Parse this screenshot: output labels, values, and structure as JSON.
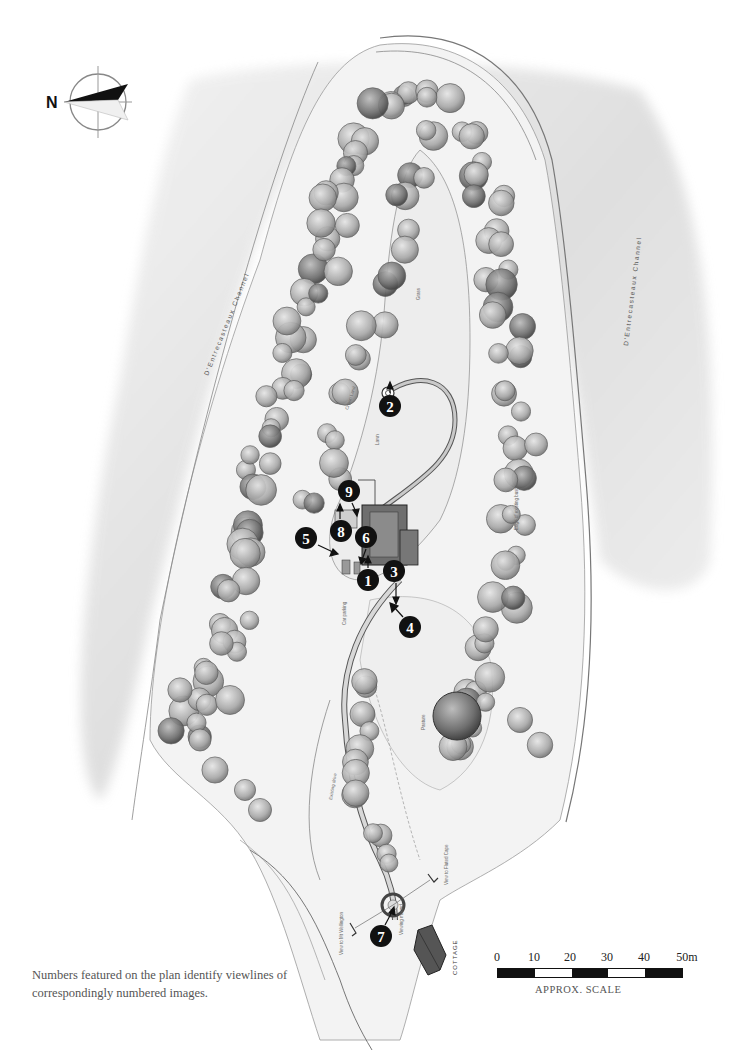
{
  "compass": {
    "north_label": "N",
    "icon": "north-arrow-compass-icon"
  },
  "map": {
    "labels": {
      "channel_left": "D'Entrecasteaux Channel",
      "channel_right": "D'Entrecasteaux Channel",
      "crown_land": "Crown Land",
      "grass": "Grass",
      "lawn": "Lawn",
      "car_parking": "Car parking",
      "pasture": "Pasture",
      "existing_drive": "Existing drive",
      "edge_of_bush": "Edge of existing bush",
      "cottage": "COTTAGE",
      "view_mt_wellington": "View to Mt Wellington",
      "view_fluted_cape": "View to Fluted Cape",
      "viewing_mound": "Viewing mound"
    },
    "viewpoints": [
      {
        "number": "1",
        "x": 368,
        "y": 580
      },
      {
        "number": "2",
        "x": 390,
        "y": 406
      },
      {
        "number": "3",
        "x": 394,
        "y": 571
      },
      {
        "number": "4",
        "x": 410,
        "y": 627
      },
      {
        "number": "5",
        "x": 306,
        "y": 538
      },
      {
        "number": "6",
        "x": 366,
        "y": 537
      },
      {
        "number": "7",
        "x": 381,
        "y": 936
      },
      {
        "number": "8",
        "x": 341,
        "y": 531
      },
      {
        "number": "9",
        "x": 349,
        "y": 491
      }
    ]
  },
  "caption": "Numbers featured on the plan identify viewlines of correspondingly numbered images.",
  "scale": {
    "ticks": [
      "0",
      "10",
      "20",
      "30",
      "40",
      "50m"
    ],
    "title": "APPROX. SCALE"
  },
  "colors": {
    "ink": "#111111",
    "pencil": "#888888",
    "paper": "#ffffff"
  }
}
